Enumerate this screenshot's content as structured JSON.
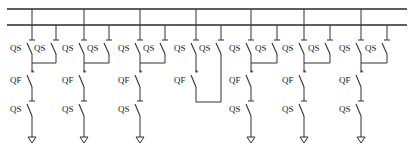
{
  "diagram": {
    "title": "",
    "colors": {
      "line": "#333333",
      "background": "#ffffff"
    },
    "buses": [
      {
        "name": "bus-1",
        "y": 9,
        "x1": 7,
        "x2": 407
      },
      {
        "name": "bus-2",
        "y": 25,
        "x1": 7,
        "x2": 407
      }
    ],
    "labels": {
      "disconnector": "QS",
      "breaker": "QF",
      "breaker_mark": "*"
    },
    "bays": [
      {
        "type": "feeder",
        "left_x": 32,
        "right_x": 56
      },
      {
        "type": "feeder",
        "left_x": 84,
        "right_x": 109
      },
      {
        "type": "feeder",
        "left_x": 140,
        "right_x": 165
      },
      {
        "type": "bus-tie",
        "left_x": 196,
        "right_x": 221
      },
      {
        "type": "feeder",
        "left_x": 251,
        "right_x": 277
      },
      {
        "type": "feeder",
        "left_x": 304,
        "right_x": 330
      },
      {
        "type": "feeder",
        "left_x": 361,
        "right_x": 387
      }
    ]
  }
}
